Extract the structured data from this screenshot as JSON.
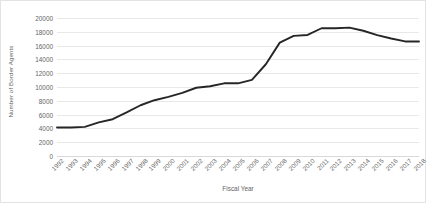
{
  "chart_data": {
    "type": "line",
    "title": "",
    "xlabel": "Fiscal Year",
    "ylabel": "Number of Border Agents",
    "categories": [
      "1992",
      "1993",
      "1994",
      "1995",
      "1996",
      "1997",
      "1998",
      "1999",
      "2000",
      "2001",
      "2002",
      "2003",
      "2004",
      "2005",
      "2006",
      "2007",
      "2008",
      "2009",
      "2010",
      "2011",
      "2012",
      "2013",
      "2014",
      "2015",
      "2016",
      "2017",
      "2018"
    ],
    "values": [
      4139,
      4139,
      4226,
      4876,
      5333,
      6315,
      7357,
      8084,
      8580,
      9147,
      9891,
      10102,
      10534,
      10534,
      11032,
      13297,
      16431,
      17415,
      17544,
      18516,
      18516,
      18611,
      18156,
      17522,
      17026,
      16605,
      16587
    ],
    "ylim": [
      0,
      20000
    ],
    "yticks": [
      0,
      2000,
      4000,
      6000,
      8000,
      10000,
      12000,
      14000,
      16000,
      18000,
      20000
    ],
    "ytick_labels": [
      "0",
      "2000",
      "4000",
      "6000",
      "8000",
      "10000",
      "12000",
      "14000",
      "16000",
      "18000",
      "20000"
    ],
    "grid": true,
    "legend": false,
    "series_color": "#262626",
    "gridline_color": "#e8e8e8",
    "axis_text_color": "#636363",
    "border_color": "#e3e3e3",
    "background": "#ffffff"
  }
}
